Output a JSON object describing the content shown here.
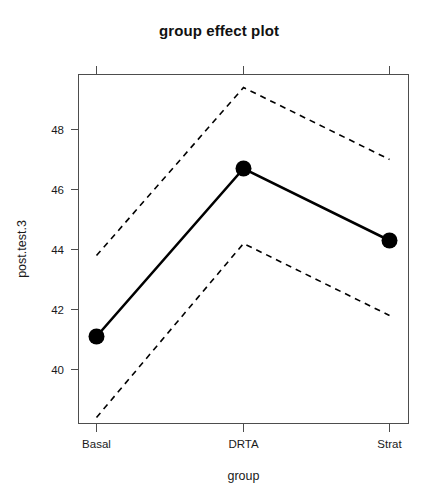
{
  "chart_data": {
    "type": "line",
    "title": "group effect plot",
    "xlabel": "group",
    "ylabel": "post.test.3",
    "categories": [
      "Basal",
      "DRTA",
      "Strat"
    ],
    "values": [
      41.1,
      46.7,
      44.3
    ],
    "series": [
      {
        "name": "fit",
        "values": [
          41.1,
          46.7,
          44.3
        ],
        "style": "solid",
        "marker": "filled-circle"
      },
      {
        "name": "upper confidence band",
        "values": [
          43.8,
          49.4,
          47.0
        ],
        "style": "dashed",
        "marker": "none"
      },
      {
        "name": "lower confidence band",
        "values": [
          38.4,
          44.2,
          41.8
        ],
        "style": "dashed",
        "marker": "none"
      }
    ],
    "xticklabels": [
      "Basal",
      "DRTA",
      "Strat"
    ],
    "yticks": [
      40,
      42,
      44,
      46,
      48
    ],
    "yticklabels": [
      "40",
      "42",
      "44",
      "46",
      "48"
    ],
    "ylim": [
      38.2,
      49.8
    ],
    "grid": false,
    "legend": false,
    "colors": {
      "line": "#000000",
      "band": "#000000",
      "axis": "#4d4d4d",
      "text": "#1a1a1a",
      "background": "#ffffff"
    }
  },
  "axes": {
    "y_tick_labels": [
      "48",
      "46",
      "44",
      "42",
      "40"
    ],
    "x_tick_labels": [
      "Basal",
      "DRTA",
      "Strat"
    ]
  }
}
